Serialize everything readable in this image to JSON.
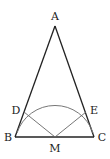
{
  "diagram": {
    "type": "geometry",
    "points": {
      "A": {
        "label": "A",
        "x": 55,
        "y": 26,
        "lx": 55,
        "ly": 20
      },
      "B": {
        "label": "B",
        "x": 15,
        "y": 137,
        "lx": 8,
        "ly": 141
      },
      "C": {
        "label": "C",
        "x": 94,
        "y": 137,
        "lx": 102,
        "ly": 141
      },
      "M": {
        "label": "M",
        "x": 55,
        "y": 137,
        "lx": 55,
        "ly": 152
      },
      "D": {
        "label": "D",
        "x": 24,
        "y": 112,
        "lx": 16,
        "ly": 112
      },
      "E": {
        "label": "E",
        "x": 86,
        "y": 112,
        "lx": 94,
        "ly": 112
      }
    },
    "segments": [
      "AB",
      "AC",
      "BC",
      "MD",
      "ME"
    ],
    "arc": {
      "center": "M",
      "radius": 40,
      "from": "near B",
      "to": "near C"
    },
    "colors": {
      "stroke": "#222222",
      "arc": "#777777",
      "thin": "#666666"
    }
  }
}
